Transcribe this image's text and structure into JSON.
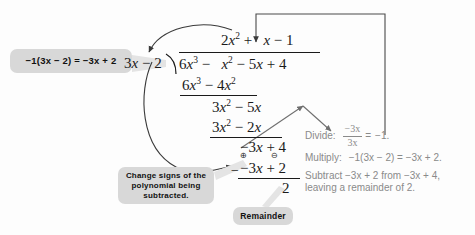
{
  "diagram": {
    "background_color": "#fdfdfd",
    "ink_color": "#1a1a1a",
    "callout_bg": "#d8d8d8",
    "panel_text_color": "#8a8a8a"
  },
  "callouts": {
    "left_box": "−1(3x − 2) = −3x + 2",
    "change_signs": "Change signs of the polynomial being subtracted.",
    "remainder": "Remainder"
  },
  "division": {
    "divisor": "3x − 2",
    "dividend": "6x³ − x² − 5x + 4",
    "quotient": "2x² + x − 1",
    "steps": [
      "6x³ − 4x²",
      "3x² − 5x",
      "3x² − 2x",
      "−3x + 4",
      "−3x + 2"
    ],
    "remainder_value": "2",
    "subtract_operator": "−",
    "sign_change_plus": "⊕",
    "sign_change_minus": "⊖"
  },
  "panel": {
    "divide_label": "Divide:",
    "divide_numerator": "−3x",
    "divide_denominator": "3x",
    "divide_equals": "=",
    "divide_result": "−1.",
    "multiply_label": "Multiply:",
    "multiply_text": "−1(3x − 2) = −3x + 2.",
    "subtract_line1": "Subtract −3x + 2 from −3x + 4,",
    "subtract_line2": "leaving a remainder of 2."
  }
}
